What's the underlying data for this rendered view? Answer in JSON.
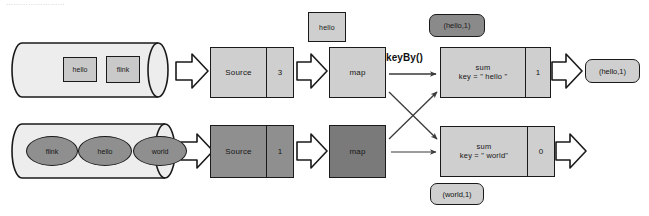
{
  "page": {
    "top_scan_text": "……………………"
  },
  "diagram": {
    "flow_label": "keyBy()",
    "colors": {
      "stroke": "#1a1a1a",
      "fill_light": "#cfcfcf",
      "fill_mid": "#b9b9b9",
      "fill_dark": "#8f8f8f",
      "fill_darker": "#7a7a7a",
      "fill_pale": "#ededed",
      "background": "#ffffff"
    },
    "streams": [
      {
        "id": "stream-top",
        "source_tokens": [
          "hello",
          "flink"
        ],
        "token_shape": "square",
        "source": {
          "label": "Source",
          "count": "3"
        },
        "map": {
          "label": "map"
        },
        "sum": {
          "label": "sum",
          "key_label": "key = \" hello \"",
          "count": "1"
        },
        "output": {
          "label": "(hello,1)"
        }
      },
      {
        "id": "stream-bottom",
        "source_tokens": [
          "flink",
          "hello",
          "world"
        ],
        "token_shape": "ellipse",
        "source": {
          "label": "Source",
          "count": "1"
        },
        "map": {
          "label": "map"
        },
        "sum": {
          "label": "sum",
          "key_label": "key = \" world\"",
          "count": "0"
        },
        "output": {
          "label": ""
        }
      }
    ],
    "floating": {
      "map_input_token": "hello",
      "badge_top": "(hello,1)",
      "badge_bottom": "(world,1)"
    }
  }
}
